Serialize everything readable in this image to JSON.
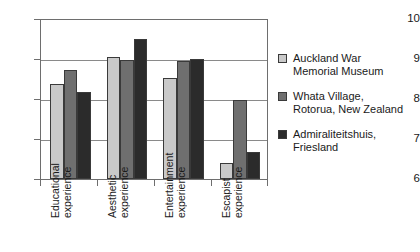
{
  "chart_data": {
    "type": "bar",
    "title": "",
    "subtitle": "",
    "xlabel": "",
    "ylabel": "",
    "ylim": [
      6,
      10
    ],
    "ytick_labels": [
      "10",
      "9",
      "8",
      "7",
      "6"
    ],
    "yticks": [
      10,
      9,
      8,
      7,
      6
    ],
    "grid": true,
    "legend_position": "right",
    "categories": [
      "Educational\nexperience",
      "Aesthetic\nexperience",
      "Entertainment\nexperience",
      "Escapist\nexperience"
    ],
    "category_lines": [
      [
        "Educational",
        "experience"
      ],
      [
        "Aesthetic",
        "experience"
      ],
      [
        "Entertainment",
        "experience"
      ],
      [
        "Escapist",
        "experience"
      ]
    ],
    "series": [
      {
        "name": "Auckland War Memorial Museum",
        "name_lines": [
          "Auckland War",
          "Memorial Museum"
        ],
        "color": "#c9c9c9",
        "values": [
          8.4,
          9.07,
          8.55,
          6.4
        ]
      },
      {
        "name": "Whata Village, Rotorua, New Zealand",
        "name_lines": [
          "Whata Village,",
          "Rotorua, New Zealand"
        ],
        "color": "#6f6f6f",
        "values": [
          8.75,
          9.0,
          8.97,
          7.98
        ]
      },
      {
        "name": "Admiraliteitshuis, Friesland",
        "name_lines": [
          "Admiraliteitshuis,",
          "Friesland"
        ],
        "color": "#2b2b2b",
        "values": [
          8.18,
          9.52,
          9.02,
          6.68
        ]
      }
    ]
  },
  "colors": {
    "axis": "#6e6e6e",
    "grid": "#8a8a8a",
    "text": "#1a1a1a",
    "background": "#ffffff"
  }
}
